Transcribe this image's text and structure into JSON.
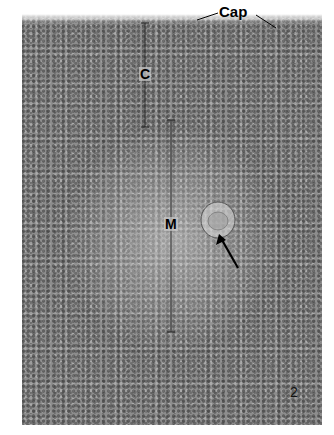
{
  "figure": {
    "type": "light micrograph",
    "number": "2",
    "labels": {
      "capsule": "Cap",
      "cortex": "C",
      "medulla": "M"
    },
    "annotations": [
      {
        "type": "bracket",
        "label": "C",
        "x": 145,
        "y_start": 22,
        "y_end": 127
      },
      {
        "type": "bracket",
        "label": "M",
        "x": 171,
        "y_start": 120,
        "y_end": 332
      },
      {
        "type": "arrow",
        "target": "circular corpuscle",
        "from": [
          238,
          268
        ],
        "to": [
          220,
          236
        ]
      },
      {
        "type": "leader-lines",
        "label": "Cap"
      }
    ],
    "colors": {
      "tissue": "#8d8d8d",
      "label": "#000000",
      "background": "#ffffff"
    }
  }
}
